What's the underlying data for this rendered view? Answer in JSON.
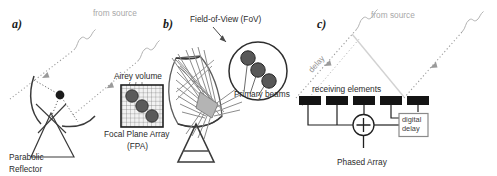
{
  "figure": {
    "background": "#ffffff"
  },
  "colors": {
    "ink": "#2b2b2b",
    "label": "#3d3d3d",
    "gray_ray": "#9a9a9a",
    "light_gray": "#c8c8c8",
    "beam_gray": "#8c8c8c",
    "dark_fill": "#4a4a4a",
    "element_fill": "#141414"
  },
  "panels": [
    {
      "id": "a",
      "label": "a)",
      "caption_lines": [
        "Parabolic",
        "Reflector"
      ],
      "annotations": [
        {
          "name": "from-source",
          "text": "from source"
        },
        {
          "name": "airey-volume",
          "text": "Airey volume"
        },
        {
          "name": "focal-plane-array",
          "text": "Focal Plane Array"
        },
        {
          "name": "fpa-acronym",
          "text": "(FPA)"
        }
      ],
      "fpa": {
        "grid_cells": 10,
        "spot_count": 3
      },
      "ray_count": 2
    },
    {
      "id": "b",
      "label": "b)",
      "annotations": [
        {
          "name": "field-of-view",
          "text": "Field-of-View (FoV)"
        },
        {
          "name": "primary-beams",
          "text": "Primary beams"
        }
      ],
      "fov": {
        "beam_count": 3
      },
      "beam_bundles": 7
    },
    {
      "id": "c",
      "label": "c)",
      "caption_lines": [
        "Phased Array"
      ],
      "annotations": [
        {
          "name": "from-source",
          "text": "from source"
        },
        {
          "name": "delay",
          "text": "delay"
        },
        {
          "name": "receiving-elements",
          "text": "receiving elements"
        },
        {
          "name": "digital-delay-line1",
          "text": "digital"
        },
        {
          "name": "digital-delay-line2",
          "text": "delay"
        }
      ],
      "elements": {
        "count": 5
      },
      "summer_symbol": "+",
      "ray_count": 2
    }
  ]
}
